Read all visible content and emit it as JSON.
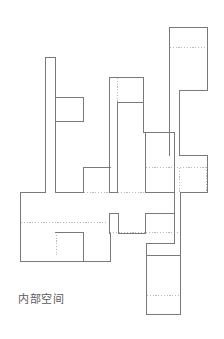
{
  "figure": {
    "caption": "内部空间",
    "caption_translation_hint": "interior-space-label",
    "background_color": "#ffffff",
    "solid_stroke_color": "#7a7a7a",
    "dotted_stroke_color": "#b9b9b9",
    "caption_color": "#5b5b5b",
    "stroke_width": 1,
    "canvas": {
      "width": 224,
      "height": 339
    }
  },
  "plan": {
    "type": "orthogonal-outline",
    "description": "interior space diagram composed of rectilinear solid boundary segments with dotted interior partition lines",
    "solid_outline_points": "169,27 207,27 207,90 179,90 179,155 207,155 207,192 180,192 180,255 146,255 146,314 180,314 180,255 146,255 146,232 132,232 132,192 109,192 109,213 118,213 118,233 145,233 145,213 174,213 174,243 146,243",
    "solid_paths": [
      "M169,27 L207,27 L207,90 L179,90 L179,155 L207,155 L207,192 L180,192 L180,255 L146,255 L146,314 L180,314 L180,255",
      "M109,77 L143,77 L143,102 L117,102 L117,192",
      "M109,77 L109,192",
      "M45,57 L55,57 L55,192",
      "M45,57 L45,192",
      "M55,97 L83,97 L83,121 L55,121",
      "M83,167 L110,167 L110,192",
      "M83,167 L83,192",
      "M145,132 L145,167 L180,167",
      "M145,132 L174,132",
      "M20,192 L45,192",
      "M20,192 L20,261 L110,261",
      "M55,232 L83,232 L83,261",
      "M109,213 L118,213 L118,233 L145,233 L145,213 L174,213 L174,243 L146,243 L146,255",
      "M109,192 L109,213",
      "M55,192 L83,192",
      "M117,192 L145,192",
      "M146,314 L146,255"
    ],
    "dotted_paths": [
      "M169,47 L207,47",
      "M55,97 L55,121",
      "M109,77 L117,77 L117,102",
      "M117,192 L145,192",
      "M20,222 L55,222",
      "M55,222 L110,222",
      "M110,232 L145,232",
      "M180,167 L207,167",
      "M180,192 L207,192",
      "M146,295 L180,295",
      "M174,167 L174,192",
      "M83,192 L109,192"
    ]
  }
}
